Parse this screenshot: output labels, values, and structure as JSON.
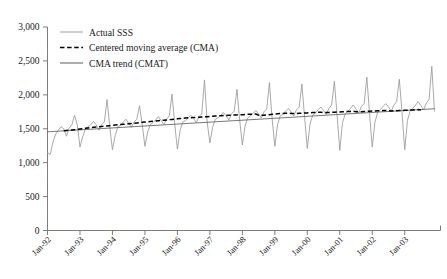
{
  "chart_data": {
    "type": "line",
    "title": "",
    "xlabel": "",
    "ylabel": "",
    "ylim": [
      0,
      3000
    ],
    "ytick_values": [
      0,
      500,
      1000,
      1500,
      2000,
      2500,
      3000
    ],
    "ytick_labels": [
      "0",
      "500",
      "1,000",
      "1,500",
      "2,000",
      "2,500",
      "3,000"
    ],
    "xtick_labels": [
      "Jan-92",
      "Jan-93",
      "Jan-94",
      "Jan-95",
      "Jan-96",
      "Jan-97",
      "Jan-98",
      "Jan-99",
      "Jan-00",
      "Jan-01",
      "Jan-02",
      "Jan-03"
    ],
    "grid": false,
    "legend_position": "top-left",
    "legend": [
      {
        "label": "Actual SSS",
        "style": "solid",
        "color": "#9a9a9a"
      },
      {
        "label": "Centered moving average (CMA)",
        "style": "dashed",
        "color": "#000000"
      },
      {
        "label": "CMA trend (CMAT)",
        "style": "solid",
        "color": "#555555"
      }
    ],
    "series": [
      {
        "name": "Actual SSS",
        "style": "solid",
        "color": "#9a9a9a",
        "values": [
          1150,
          1120,
          1300,
          1420,
          1480,
          1530,
          1500,
          1390,
          1510,
          1560,
          1700,
          1560,
          1230,
          1380,
          1500,
          1530,
          1560,
          1610,
          1560,
          1480,
          1560,
          1600,
          1930,
          1530,
          1190,
          1400,
          1530,
          1550,
          1600,
          1640,
          1580,
          1520,
          1600,
          1640,
          1840,
          1560,
          1240,
          1450,
          1560,
          1590,
          1630,
          1680,
          1620,
          1560,
          1640,
          1690,
          2010,
          1570,
          1200,
          1480,
          1600,
          1620,
          1660,
          1700,
          1650,
          1590,
          1680,
          1720,
          2220,
          1600,
          1290,
          1520,
          1640,
          1660,
          1700,
          1740,
          1690,
          1630,
          1720,
          1760,
          2080,
          1630,
          1260,
          1540,
          1660,
          1690,
          1730,
          1770,
          1720,
          1660,
          1750,
          1790,
          2180,
          1650,
          1240,
          1560,
          1690,
          1710,
          1760,
          1800,
          1750,
          1690,
          1780,
          1820,
          2160,
          1670,
          1210,
          1570,
          1700,
          1730,
          1780,
          1820,
          1770,
          1710,
          1800,
          1850,
          2200,
          1700,
          1180,
          1590,
          1720,
          1760,
          1800,
          1850,
          1790,
          1730,
          1830,
          1870,
          2260,
          1720,
          1230,
          1600,
          1740,
          1780,
          1830,
          1870,
          1820,
          1760,
          1850,
          1900,
          2230,
          1740,
          1190,
          1620,
          1760,
          1800,
          1850,
          1900,
          1840,
          1780,
          1880,
          1930,
          2420,
          1760
        ]
      },
      {
        "name": "Centered moving average (CMA)",
        "style": "dashed",
        "color": "#000000",
        "start_index": 6,
        "values": [
          1470,
          1475,
          1478,
          1482,
          1486,
          1490,
          1495,
          1500,
          1506,
          1512,
          1518,
          1522,
          1526,
          1530,
          1534,
          1538,
          1542,
          1546,
          1550,
          1554,
          1558,
          1562,
          1566,
          1570,
          1574,
          1578,
          1582,
          1586,
          1590,
          1594,
          1598,
          1602,
          1606,
          1610,
          1614,
          1618,
          1622,
          1626,
          1630,
          1634,
          1638,
          1642,
          1646,
          1650,
          1654,
          1658,
          1662,
          1664,
          1666,
          1668,
          1670,
          1672,
          1675,
          1678,
          1681,
          1684,
          1687,
          1690,
          1692,
          1694,
          1696,
          1698,
          1700,
          1702,
          1704,
          1706,
          1708,
          1710,
          1712,
          1714,
          1716,
          1718,
          1700,
          1698,
          1700,
          1704,
          1708,
          1712,
          1716,
          1720,
          1724,
          1726,
          1728,
          1730,
          1726,
          1724,
          1726,
          1728,
          1730,
          1732,
          1734,
          1736,
          1738,
          1740,
          1742,
          1744,
          1740,
          1738,
          1740,
          1742,
          1744,
          1746,
          1748,
          1750,
          1752,
          1754,
          1756,
          1758,
          1752,
          1750,
          1752,
          1754,
          1756,
          1758,
          1760,
          1762,
          1764,
          1766,
          1768,
          1770,
          1764,
          1762,
          1764,
          1766,
          1768,
          1770,
          1772,
          1774,
          1776,
          1778,
          1780,
          1782,
          1776
        ]
      },
      {
        "name": "CMA trend (CMAT)",
        "style": "solid",
        "color": "#555555",
        "start_index": 0,
        "endpoints": [
          {
            "index": 0,
            "value": 1455
          },
          {
            "index": 143,
            "value": 1795
          }
        ]
      }
    ]
  }
}
